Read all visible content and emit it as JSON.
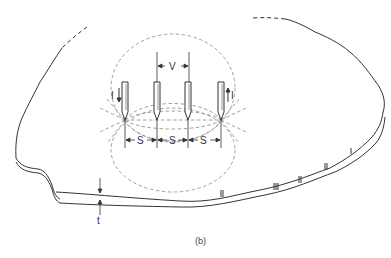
{
  "figure": {
    "caption": "(b)",
    "labels": {
      "voltage": "V",
      "current_left": "I",
      "current_right": "I",
      "spacing_1": "S",
      "spacing_2": "S",
      "spacing_3": "S",
      "thickness": "t"
    },
    "probes": [
      {
        "name": "outer-left",
        "current": "in"
      },
      {
        "name": "inner-left"
      },
      {
        "name": "inner-right"
      },
      {
        "name": "outer-right",
        "current": "out"
      }
    ],
    "colors": {
      "line": "#333333",
      "dashed": "#888888",
      "background": "#ffffff"
    }
  }
}
